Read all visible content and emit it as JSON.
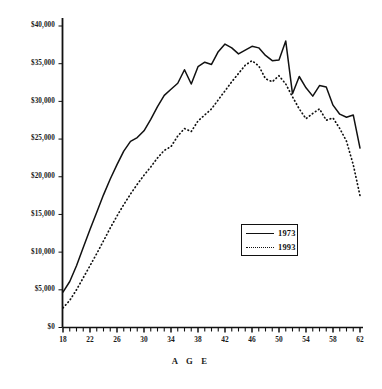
{
  "chart_data": {
    "type": "line",
    "title": "",
    "xlabel": "A G E",
    "ylabel": "",
    "xlim": [
      18,
      62
    ],
    "ylim": [
      0,
      40000
    ],
    "grid": false,
    "legend_position": "center-right",
    "x_tick_labels": [
      "18",
      "22",
      "26",
      "30",
      "34",
      "38",
      "42",
      "46",
      "50",
      "54",
      "58",
      "62"
    ],
    "x_tick_values": [
      18,
      22,
      26,
      30,
      34,
      38,
      42,
      46,
      50,
      54,
      58,
      62
    ],
    "x_minor_tick_step": 1,
    "y_tick_labels": [
      "$0",
      "$5,000",
      "$10,000",
      "$15,000",
      "$20,000",
      "$25,000",
      "$30,000",
      "$35,000",
      "$40,000"
    ],
    "y_tick_values": [
      0,
      5000,
      10000,
      15000,
      20000,
      25000,
      30000,
      35000,
      40000
    ],
    "x": [
      18,
      19,
      20,
      21,
      22,
      23,
      24,
      25,
      26,
      27,
      28,
      29,
      30,
      31,
      32,
      33,
      34,
      35,
      36,
      37,
      38,
      39,
      40,
      41,
      42,
      43,
      44,
      45,
      46,
      47,
      48,
      49,
      50,
      51,
      52,
      53,
      54,
      55,
      56,
      57,
      58,
      59,
      60,
      61,
      62
    ],
    "series": [
      {
        "name": "1973",
        "style": "solid",
        "color": "#111111",
        "values": [
          4700,
          6100,
          8200,
          10600,
          13000,
          15300,
          17600,
          19700,
          21600,
          23400,
          24700,
          25200,
          26100,
          27600,
          29300,
          30800,
          31600,
          32400,
          34200,
          32300,
          34600,
          35200,
          34900,
          36600,
          37600,
          37100,
          36300,
          36800,
          37300,
          37100,
          36100,
          35400,
          35500,
          38000,
          31000,
          33300,
          31800,
          30700,
          32100,
          31900,
          29500,
          28300,
          27900,
          28200,
          23800
        ]
      },
      {
        "name": "1993",
        "style": "dotted",
        "color": "#111111",
        "values": [
          2600,
          3600,
          5000,
          6600,
          8200,
          9800,
          11500,
          13200,
          14800,
          16300,
          17700,
          19000,
          20200,
          21300,
          22500,
          23500,
          24000,
          25400,
          26400,
          26000,
          27400,
          28200,
          29000,
          30200,
          31400,
          32600,
          33700,
          34800,
          35400,
          34700,
          33000,
          32600,
          33400,
          32300,
          30600,
          29000,
          27700,
          28400,
          29000,
          27500,
          27800,
          26400,
          24700,
          21600,
          17500
        ]
      }
    ]
  },
  "legend": {
    "entries": [
      {
        "label": "1973",
        "style": "solid"
      },
      {
        "label": "1993",
        "style": "dotted"
      }
    ]
  },
  "axes": {
    "x_axis_title": "A G E"
  }
}
